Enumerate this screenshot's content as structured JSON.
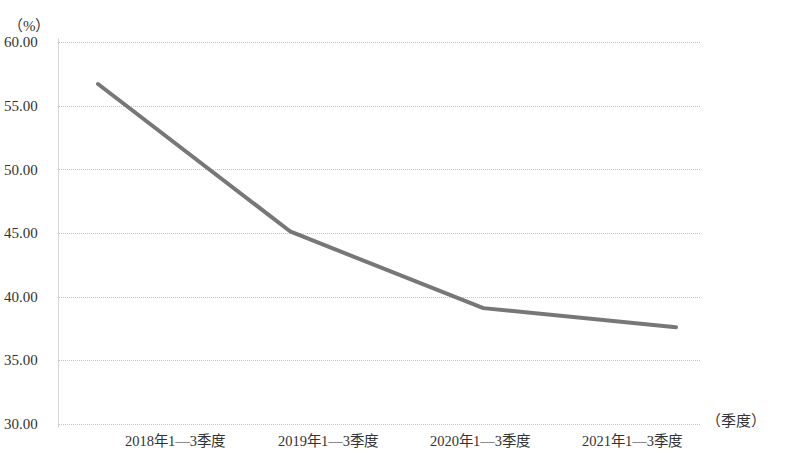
{
  "chart_data": {
    "type": "line",
    "title": "",
    "subtitle": "",
    "xlabel": "（季度）",
    "ylabel": "（%）",
    "categories": [
      "2018年1—3季度",
      "2019年1—3季度",
      "2020年1—3季度",
      "2021年1—3季度"
    ],
    "values": [
      56.7,
      45.1,
      39.1,
      37.6
    ],
    "series": [
      {
        "name": "",
        "values": [
          56.7,
          45.1,
          39.1,
          37.6
        ]
      }
    ],
    "ylim": [
      30.0,
      60.0
    ],
    "ytick_step": 5.0,
    "ytick_labels": [
      "60.00",
      "55.00",
      "50.00",
      "45.00",
      "40.00",
      "35.00",
      "30.00"
    ],
    "ytick_values": [
      60.0,
      55.0,
      50.0,
      45.0,
      40.0,
      35.0,
      30.0
    ],
    "grid": true,
    "grid_style": "dotted",
    "grid_color": "#c4c4c4",
    "legend": false,
    "legend_position": "none",
    "markers": false,
    "line_color": "#77777a",
    "line_width": 4,
    "background_color": "#ffffff",
    "text_color": "#333333"
  }
}
